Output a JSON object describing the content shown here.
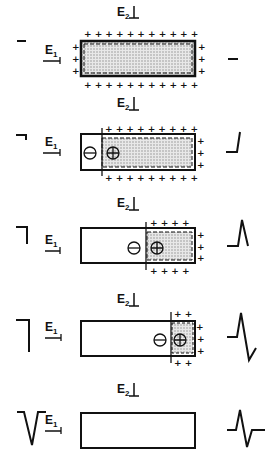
{
  "electrodes": {
    "e1": "E",
    "e1_sub": "1",
    "e2": "E",
    "e2_sub": "2"
  },
  "stages": [
    {
      "id": 1,
      "left_trace": "flat-low",
      "right_trace": "flat",
      "depolarized_fraction": 0.0,
      "polarity_markers": "none",
      "note": "resting, fully polarized"
    },
    {
      "id": 2,
      "left_trace": "step-down",
      "right_trace": "rise-start",
      "depolarized_fraction": 0.2,
      "polarity_markers": "minus-plus",
      "note": "depolarization enters at left"
    },
    {
      "id": 3,
      "left_trace": "step-down",
      "right_trace": "peak",
      "depolarized_fraction": 0.62,
      "polarity_markers": "minus-plus"
    },
    {
      "id": 4,
      "left_trace": "step-down-long",
      "right_trace": "peak-and-undershoot",
      "depolarized_fraction": 0.85,
      "polarity_markers": "minus-plus"
    },
    {
      "id": 5,
      "left_trace": "full-action",
      "right_trace": "biphasic",
      "depolarized_fraction": 1.0,
      "polarity_markers": "none",
      "note": "fully depolarized"
    }
  ],
  "symbols": {
    "plus": "+",
    "minus": "−"
  },
  "colors": {
    "ink": "#111111",
    "shade": "#cfcfcf"
  }
}
